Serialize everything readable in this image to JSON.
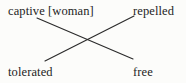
{
  "figure": {
    "type": "crossing-diagram",
    "background_color": "#fcfcfa",
    "line_color": "#2b2b2b",
    "text_color": "#242424",
    "terms": {
      "top_left": "captive [woman]",
      "top_right": "repelled",
      "bottom_left": "tolerated",
      "bottom_right": "free"
    },
    "connections": [
      {
        "from": "top_left",
        "to": "bottom_right"
      },
      {
        "from": "bottom_left",
        "to": "top_right"
      }
    ],
    "geometry": {
      "line_a": {
        "x1": 37,
        "y1": 18,
        "x2": 133,
        "y2": 59
      },
      "line_b": {
        "x1": 45,
        "y1": 61,
        "x2": 134,
        "y2": 16
      },
      "crossing_point": {
        "x": 88,
        "y": 39
      }
    }
  }
}
